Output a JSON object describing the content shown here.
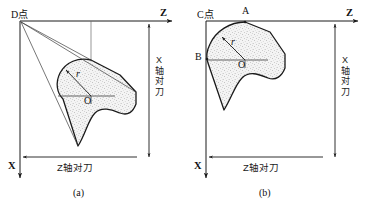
{
  "figure": {
    "kind": "engineering-diagram",
    "panels": [
      {
        "id": "a",
        "caption": "(a)",
        "origin_label": "D点",
        "axis_z_label": "Z",
        "axis_x_label": "X",
        "dim_vertical_label": "X轴对刀",
        "dim_horizontal_label": "Z轴对刀",
        "radius_label": "r",
        "center_label": "O",
        "point_labels": []
      },
      {
        "id": "b",
        "caption": "(b)",
        "origin_label": "C点",
        "axis_z_label": "Z",
        "axis_x_label": "X",
        "dim_vertical_label": "X轴对刀",
        "dim_horizontal_label": "Z轴对刀",
        "radius_label": "r",
        "center_label": "O",
        "point_labels": [
          "A",
          "B"
        ]
      }
    ]
  },
  "colors": {
    "line": "#1a1a1a",
    "thin_line": "#4a4a4a",
    "fill": "#f2f2f2",
    "stipple": "#6b6b6b",
    "background": "#ffffff"
  }
}
